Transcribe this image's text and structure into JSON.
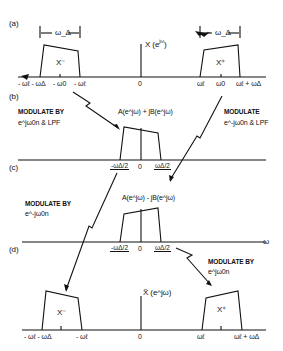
{
  "figure": {
    "panels": {
      "a": {
        "tag": "(a)",
        "function_label": "X (e^jω)",
        "function_text": "X (e",
        "function_sup": "jω",
        "function_close": ")",
        "width_label": "ω_Δ",
        "lobe_neg": "X⁻",
        "lobe_pos": "X⁺",
        "ticks_neg": [
          "- ωℓ - ωΔ",
          "- ω0",
          "- ωℓ"
        ],
        "tick_zero": "0",
        "ticks_pos": [
          "ωℓ",
          "ω0",
          "ωℓ + ωΔ"
        ]
      },
      "b": {
        "tag": "(b)",
        "left_note_line1": "MODULATE BY",
        "left_note_line2": "e^jω0n & LPF",
        "right_note_line1": "MODULATE",
        "right_note_line2": "e^-jω0n & LPF",
        "function_label": "A(e^jω) + jB(e^jω)",
        "ticks": [
          "-ωΔ/2",
          "0",
          "ωΔ/2"
        ]
      },
      "c": {
        "tag": "(c)",
        "left_note_line1": "MODULATE BY",
        "left_note_line2": "e^-jω0n",
        "function_label": "A(e^jω) - jB(e^jω)",
        "ticks": [
          "-ωΔ/2",
          "0",
          "ωΔ/2"
        ],
        "axis_label": "ω"
      },
      "d": {
        "tag": "(d)",
        "right_note_line1": "MODULATE BY",
        "right_note_line2": "e^jω0n",
        "function_label": "X̃ (e^jω)",
        "lobe_neg": "X⁻",
        "lobe_pos": "X⁺",
        "ticks_neg": [
          "- ωℓ - ωΔ",
          "- ωℓ"
        ],
        "tick_zero": "0",
        "ticks_pos": [
          "ωℓ",
          "ωℓ + ωΔ"
        ]
      }
    }
  }
}
